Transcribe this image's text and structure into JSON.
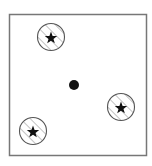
{
  "diagram": {
    "frame": {
      "x": 9,
      "y": 14,
      "width": 138,
      "height": 142,
      "stroke": "#777777"
    },
    "center_dot": {
      "cx": 74,
      "cy": 85,
      "r": 5,
      "fill": "#111111"
    },
    "targets": [
      {
        "id": "top-left",
        "cx": 51,
        "cy": 37,
        "r": 13.5,
        "icon": "star-icon"
      },
      {
        "id": "right",
        "cx": 121,
        "cy": 107,
        "r": 13.5,
        "icon": "star-icon"
      },
      {
        "id": "bottom-left",
        "cx": 33,
        "cy": 131,
        "r": 13.5,
        "icon": "star-icon"
      }
    ],
    "colors": {
      "circle_stroke": "#555555",
      "hatch": "#9a9a9a",
      "star": "#111111",
      "background": "#ffffff"
    }
  }
}
